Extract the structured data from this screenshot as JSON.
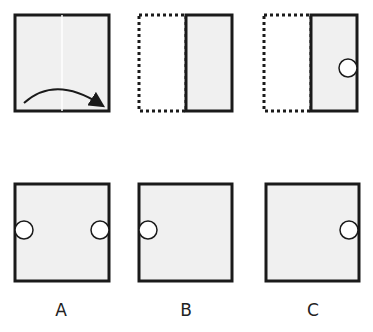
{
  "puzzle": {
    "type": "paper-folding",
    "steps": [
      {
        "id": "step-1",
        "description": "Square sheet folded along vertical center line, left-to-right",
        "fold_arrow": "left-to-right"
      },
      {
        "id": "step-2",
        "description": "Folded sheet; dotted outline shows original left half"
      },
      {
        "id": "step-3",
        "description": "Hole punched at right edge, middle height, of folded sheet"
      }
    ],
    "options": [
      {
        "label": "A",
        "holes": [
          "left-edge-middle",
          "right-edge-middle"
        ]
      },
      {
        "label": "B",
        "holes": [
          "left-edge-middle"
        ]
      },
      {
        "label": "C",
        "holes": [
          "right-edge-middle"
        ]
      }
    ]
  },
  "colors": {
    "paper_fill": "#f0f0f0",
    "stroke": "#1a1a1a",
    "hole_fill": "#ffffff"
  }
}
